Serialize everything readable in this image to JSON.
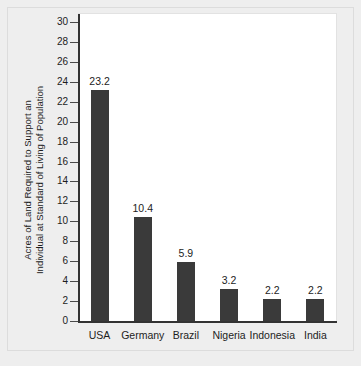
{
  "chart_data": {
    "type": "bar",
    "title": "",
    "xlabel": "",
    "ylabel": "Acres of Land Required to Support an Individual at Standard of Living of Population",
    "ylabel_line1": "Acres of Land Required to Support an",
    "ylabel_line2": "Individual at Standard of Living of Population",
    "categories": [
      "USA",
      "Germany",
      "Brazil",
      "Nigeria",
      "Indonesia",
      "India"
    ],
    "values": [
      23.2,
      10.4,
      5.9,
      3.2,
      2.2,
      2.2
    ],
    "value_labels": [
      "23.2",
      "10.4",
      "5.9",
      "3.2",
      "2.2",
      "2.2"
    ],
    "ylim": [
      0,
      30
    ],
    "ytick_step": 2,
    "yticks": [
      0,
      2,
      4,
      6,
      8,
      10,
      12,
      14,
      16,
      18,
      20,
      22,
      24,
      26,
      28,
      30
    ],
    "ytick_labels": [
      "0",
      "2",
      "4",
      "6",
      "8",
      "10",
      "12",
      "14",
      "16",
      "18",
      "20",
      "22",
      "24",
      "26",
      "28",
      "30"
    ],
    "grid": false,
    "legend": false,
    "bar_color": "#3a3a3a",
    "axis_color": "#333333",
    "plot_background": "#ffffff",
    "page_background": "#eeeeee"
  }
}
